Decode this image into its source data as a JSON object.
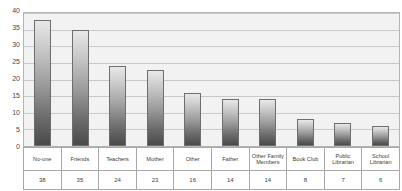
{
  "chart_data": {
    "type": "bar",
    "title": "",
    "subtitle": "",
    "xlabel": "",
    "ylabel": "",
    "ylim": [
      0,
      40
    ],
    "ytick_step": 5,
    "yticks": [
      40,
      35,
      30,
      25,
      20,
      15,
      10,
      5,
      0
    ],
    "grid": true,
    "legend": null,
    "categories": [
      "No-one",
      "Friends",
      "Teachers",
      "Mother",
      "Other",
      "Father",
      "Other Family Members",
      "Book Club",
      "Public Librarian",
      "School Librarian"
    ],
    "values": [
      38,
      35,
      24,
      23,
      16,
      14,
      14,
      8,
      7,
      6
    ],
    "value_labels": [
      "38",
      "35",
      "24",
      "23",
      "16",
      "14",
      "14",
      "8",
      "7",
      "6"
    ],
    "colors": {
      "bar_top": "#e8e8e8",
      "bar_bottom": "#4a4a4a",
      "bar_border": "#6e6e6e",
      "plot_background": "#f2f2f2",
      "gridline": "#c8c8c8",
      "axis_text": "#4a4a4a",
      "table_border": "#a8a8a8"
    }
  }
}
